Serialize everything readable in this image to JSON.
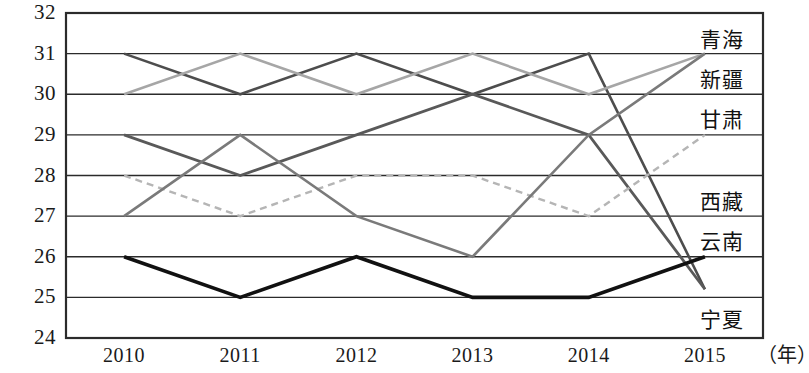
{
  "chart_data": {
    "type": "line",
    "title": "",
    "xlabel": "年",
    "ylabel": "",
    "categories": [
      "2010",
      "2011",
      "2012",
      "2013",
      "2014",
      "2015"
    ],
    "ylim": [
      24,
      32
    ],
    "yticks": [
      "24",
      "25",
      "26",
      "27",
      "28",
      "29",
      "30",
      "31",
      "32"
    ],
    "grid": true,
    "legend_position": "right",
    "series": [
      {
        "name": "青海",
        "values": [
          31,
          30,
          31,
          30,
          31,
          25.2
        ],
        "color": "#4d4d4d",
        "style": "solid",
        "width": 2.6
      },
      {
        "name": "新疆",
        "values": [
          30,
          31,
          30,
          31,
          30,
          31
        ],
        "color": "#a6a6a6",
        "style": "solid",
        "width": 2.6
      },
      {
        "name": "甘肃",
        "values": [
          29,
          28,
          29,
          30,
          29,
          25.2
        ],
        "color": "#595959",
        "style": "solid",
        "width": 2.8
      },
      {
        "name": "西藏",
        "values": [
          28,
          27,
          28,
          28,
          27,
          29
        ],
        "color": "#b5b5b5",
        "style": "dashed",
        "width": 2.4
      },
      {
        "name": "云南",
        "values": [
          27,
          29,
          27,
          26,
          29,
          31
        ],
        "color": "#7a7a7a",
        "style": "solid",
        "width": 2.6
      },
      {
        "name": "宁夏",
        "values": [
          26,
          25,
          26,
          25,
          25,
          26
        ],
        "color": "#111111",
        "style": "solid",
        "width": 3.6
      }
    ]
  },
  "axis": {
    "unit_label": "（年）"
  },
  "legend": {
    "entries": [
      {
        "label": "青海"
      },
      {
        "label": "新疆"
      },
      {
        "label": "甘肃"
      },
      {
        "label": "西藏"
      },
      {
        "label": "云南"
      },
      {
        "label": "宁夏"
      }
    ]
  }
}
